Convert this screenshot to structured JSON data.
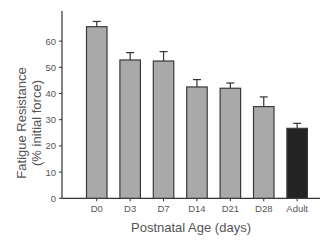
{
  "chart_data": {
    "type": "bar",
    "title": "",
    "xlabel": "Postnatal Age (days)",
    "ylabel": "Fatigue Resistance",
    "ylabel_line2": "(% initial force)",
    "categories": [
      "D0",
      "D3",
      "D7",
      "D14",
      "D21",
      "D28",
      "Adult"
    ],
    "values": [
      65.5,
      52.8,
      52.4,
      42.5,
      42.0,
      35.0,
      26.7
    ],
    "errors": [
      2.0,
      2.8,
      3.6,
      2.8,
      2.0,
      3.7,
      1.9
    ],
    "colors": [
      "#a9a9a9",
      "#a9a9a9",
      "#a9a9a9",
      "#a9a9a9",
      "#a9a9a9",
      "#a9a9a9",
      "#232323"
    ],
    "ylim": [
      0,
      70
    ],
    "yticks": [
      0,
      10,
      20,
      30,
      40,
      50,
      60
    ],
    "grid": false,
    "legend": null
  }
}
